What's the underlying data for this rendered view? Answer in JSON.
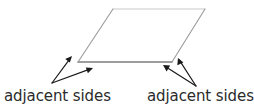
{
  "diagram": {
    "background_color": "#ffffff",
    "shape": {
      "name": "parallelogram",
      "vertices": [
        {
          "label": "top-left",
          "x": 113,
          "y": 9
        },
        {
          "label": "top-right",
          "x": 205,
          "y": 9
        },
        {
          "label": "bottom-right",
          "x": 172,
          "y": 62
        },
        {
          "label": "bottom-left",
          "x": 78,
          "y": 62
        }
      ],
      "fill_color": "#ffffff",
      "edge_colors": {
        "top": "#c9c9c9",
        "right": "#9a9a9a",
        "bottom": "#7d7d7d",
        "left": "#9a9a9a"
      }
    },
    "arrow_color": "#1a1a1a",
    "arrow_groups": [
      {
        "name": "left-arrow-group",
        "origin": {
          "x": 52,
          "y": 83
        },
        "arrows": [
          {
            "name": "left-arrow-upper",
            "tip_x": 72,
            "tip_y": 56,
            "points_to": "left-slanted-side"
          },
          {
            "name": "left-arrow-lower",
            "tip_x": 93,
            "tip_y": 68,
            "points_to": "bottom-side"
          }
        ]
      },
      {
        "name": "right-arrow-group",
        "origin": {
          "x": 196,
          "y": 86
        },
        "arrows": [
          {
            "name": "right-arrow-upper",
            "tip_x": 178,
            "tip_y": 58,
            "points_to": "right-slanted-side"
          },
          {
            "name": "right-arrow-lower",
            "tip_x": 163,
            "tip_y": 65,
            "points_to": "bottom-side"
          }
        ]
      }
    ],
    "labels": {
      "left": "adjacent sides",
      "right": "adjacent sides"
    }
  }
}
